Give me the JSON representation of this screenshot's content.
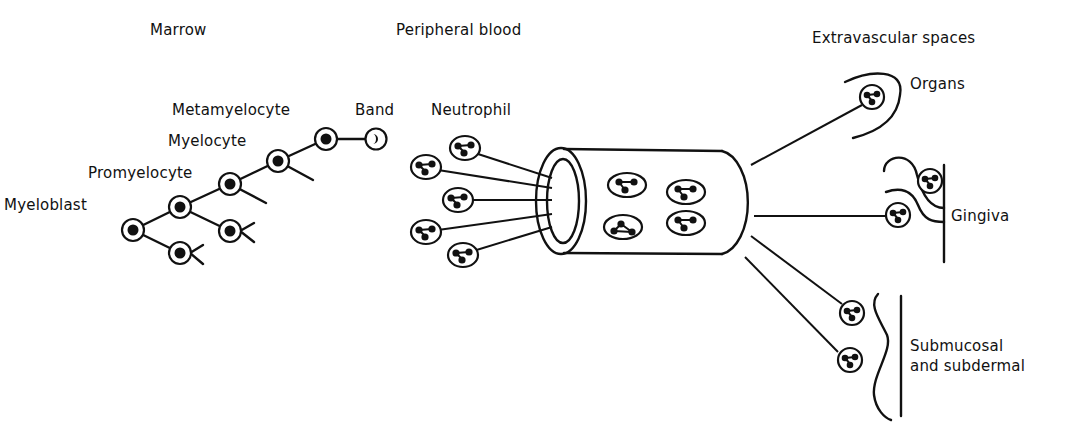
{
  "figure": {
    "sections": {
      "marrow": "Marrow",
      "peripheral_blood": "Peripheral blood",
      "extravascular": "Extravascular spaces"
    },
    "marrow_stages": [
      {
        "label": "Myeloblast"
      },
      {
        "label": "Promyelocyte"
      },
      {
        "label": "Myelocyte"
      },
      {
        "label": "Metamyelocyte"
      },
      {
        "label": "Band"
      }
    ],
    "blood_label": "Neutrophil",
    "extravascular_sites": [
      {
        "label": "Organs"
      },
      {
        "label": "Gingiva"
      },
      {
        "label_line1": "Submucosal",
        "label_line2": "and subdermal"
      }
    ],
    "colors": {
      "ink": "#111111",
      "background": "#ffffff"
    }
  }
}
